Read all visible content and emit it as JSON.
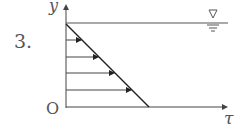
{
  "problem_number": "3.",
  "axes": {
    "y_label": "y",
    "x_label": "τ",
    "origin_label": "O"
  },
  "free_surface_symbol": "∇",
  "diagram": {
    "type": "shear stress distribution",
    "arrow_count": 4
  }
}
